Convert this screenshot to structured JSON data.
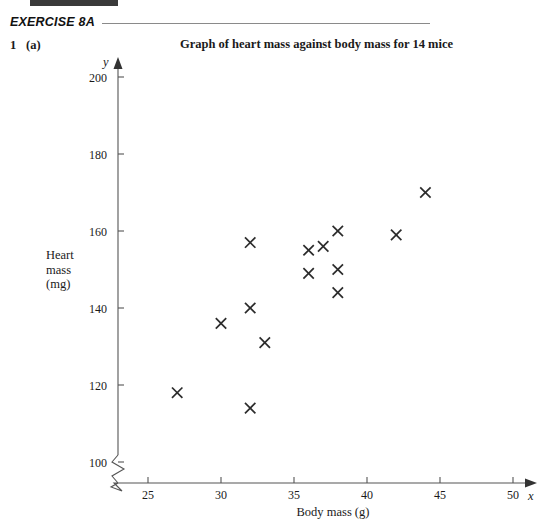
{
  "header": {
    "exercise_label": "EXERCISE 8A",
    "question_number": "1",
    "question_part": "(a)"
  },
  "chart_data": {
    "type": "scatter",
    "title": "Graph of heart mass against body mass for 14 mice",
    "xlabel": "Body mass (g)",
    "ylabel_lines": [
      "Heart",
      "mass",
      "(mg)"
    ],
    "x_axis_variable": "x",
    "y_axis_variable": "y",
    "xlim": [
      23.5,
      50
    ],
    "ylim": [
      96,
      205
    ],
    "xticks": [
      25,
      30,
      35,
      40,
      45,
      50
    ],
    "xtick_labels": [
      "25",
      "30",
      "35",
      "40",
      "45",
      "50"
    ],
    "yticks": [
      100,
      120,
      140,
      160,
      180,
      200
    ],
    "ytick_labels": [
      "100",
      "120",
      "140",
      "160",
      "180",
      "200"
    ],
    "grid": false,
    "legend": null,
    "axis_break_x": true,
    "axis_break_y": true,
    "marker": "cross",
    "marker_color": "#2b2b2b",
    "n_points": 14,
    "x": [
      27,
      30,
      32,
      32,
      33,
      32,
      36,
      36,
      37,
      38,
      38,
      38,
      42,
      44
    ],
    "y": [
      118,
      136,
      114,
      140,
      131,
      157,
      149,
      155,
      156,
      160,
      150,
      144,
      159,
      170
    ],
    "points": [
      {
        "x": 27,
        "y": 118
      },
      {
        "x": 30,
        "y": 136
      },
      {
        "x": 32,
        "y": 114
      },
      {
        "x": 32,
        "y": 140
      },
      {
        "x": 33,
        "y": 131
      },
      {
        "x": 32,
        "y": 157
      },
      {
        "x": 36,
        "y": 149
      },
      {
        "x": 36,
        "y": 155
      },
      {
        "x": 37,
        "y": 156
      },
      {
        "x": 38,
        "y": 160
      },
      {
        "x": 38,
        "y": 150
      },
      {
        "x": 38,
        "y": 144
      },
      {
        "x": 42,
        "y": 159
      },
      {
        "x": 44,
        "y": 170
      }
    ]
  },
  "colors": {
    "axis": "#555555",
    "marker": "#2b2b2b",
    "rule": "#8a8a8a",
    "top_bar": "#3a3a3a"
  }
}
